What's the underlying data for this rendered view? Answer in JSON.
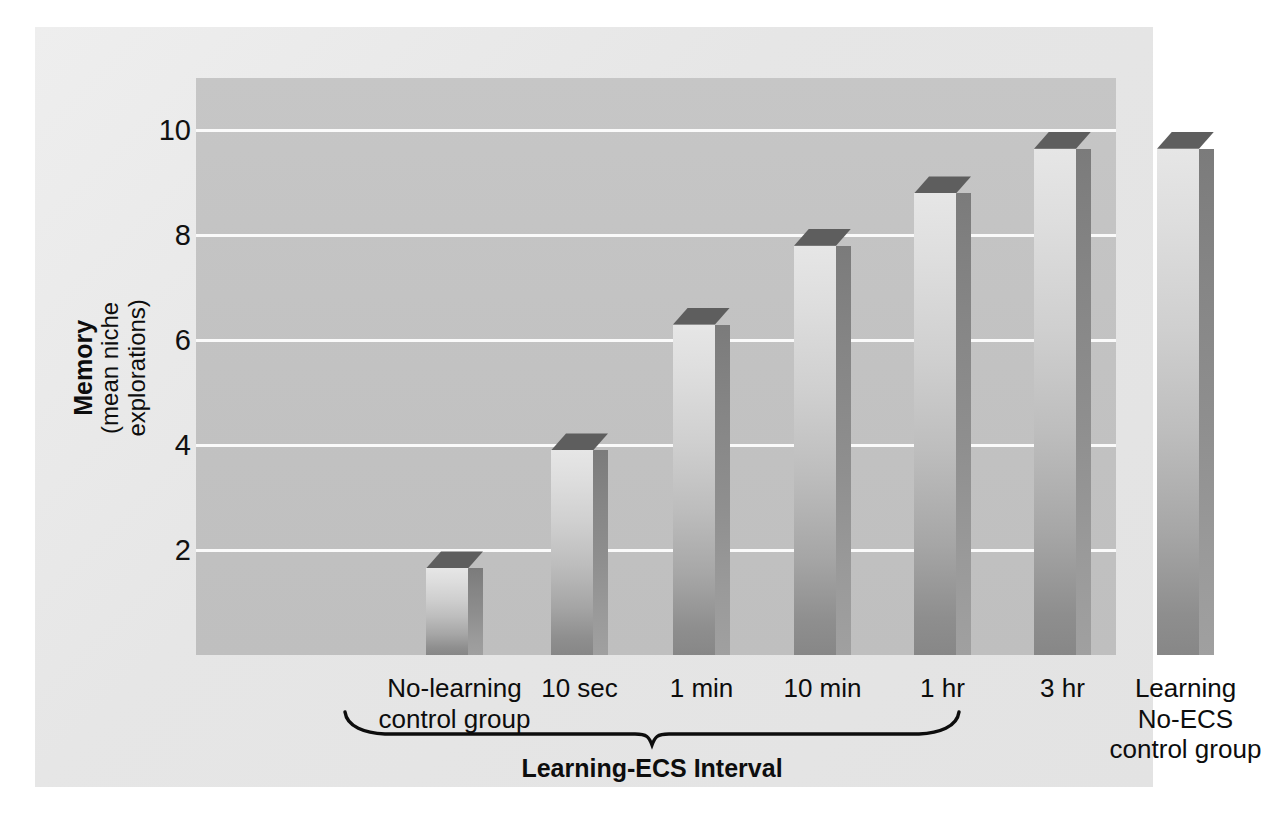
{
  "chart_data": {
    "type": "bar",
    "title": "",
    "subtitle": "",
    "xlabel": "Learning-ECS Interval",
    "ylabel": "Memory",
    "ylabel_sub": "(mean niche explorations)",
    "ylim": [
      0,
      11
    ],
    "yticks": [
      2,
      4,
      6,
      8,
      10
    ],
    "ytick_labels": [
      "2",
      "4",
      "6",
      "8",
      "10"
    ],
    "grid": "horizontal",
    "legend": "none",
    "categories": [
      "No-learning\ncontrol group",
      "10 sec",
      "1 min",
      "10 min",
      "1 hr",
      "3 hr",
      "Learning\nNo-ECS\ncontrol group"
    ],
    "values": [
      1.65,
      3.9,
      6.3,
      7.8,
      8.8,
      9.65,
      9.65
    ],
    "series": [
      {
        "name": "Memory",
        "values": [
          1.65,
          3.9,
          6.3,
          7.8,
          8.8,
          9.65,
          9.65
        ]
      }
    ],
    "annotations": [
      {
        "name": "learning-ecs-brace",
        "text": "Learning-ECS Interval",
        "spans_categories": [
          "10 sec",
          "1 min",
          "10 min",
          "1 hr",
          "3 hr"
        ]
      }
    ],
    "style": "3d-bars-grayscale"
  },
  "axis": {
    "y_title_main": "Memory",
    "y_title_sub": "(mean niche explorations)",
    "y_ticks": [
      "10",
      "8",
      "6",
      "4",
      "2"
    ]
  },
  "x_labels": [
    {
      "line1": "No-learning",
      "line2": "control group",
      "line3": ""
    },
    {
      "line1": "10 sec",
      "line2": "",
      "line3": ""
    },
    {
      "line1": "1 min",
      "line2": "",
      "line3": ""
    },
    {
      "line1": "10 min",
      "line2": "",
      "line3": ""
    },
    {
      "line1": "1 hr",
      "line2": "",
      "line3": ""
    },
    {
      "line1": "3 hr",
      "line2": "",
      "line3": ""
    },
    {
      "line1": "Learning",
      "line2": "No-ECS",
      "line3": "control group"
    }
  ],
  "brace": {
    "label": "Learning-ECS Interval"
  },
  "colors": {
    "figure_background": "#e6e6e6",
    "plot_background": "#c2c2c2",
    "gridline": "#fafafa",
    "bar_front_top": "#e6e6e6",
    "bar_front_bottom": "#878787",
    "bar_side": "#8a8a8a",
    "bar_top": "#5e5e5e",
    "text": "#0d0d0d"
  }
}
